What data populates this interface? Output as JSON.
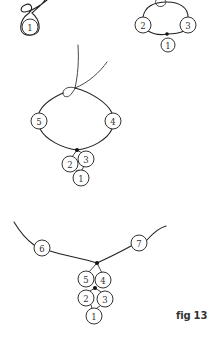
{
  "figure": {
    "caption": "fig 13",
    "colors": {
      "thread": "#222222",
      "bead_outline": "#333333",
      "knot": "#111111",
      "background": "#ffffff"
    }
  },
  "steps": [
    {
      "id": "step-1",
      "beads": [
        {
          "label": "1",
          "cx": 30,
          "cy": 27,
          "r": 8
        }
      ],
      "knots": []
    },
    {
      "id": "step-2",
      "beads": [
        {
          "label": "2",
          "cx": 143,
          "cy": 25,
          "r": 8
        },
        {
          "label": "3",
          "cx": 188,
          "cy": 25,
          "r": 8
        },
        {
          "label": "1",
          "cx": 168,
          "cy": 45,
          "r": 7
        }
      ],
      "knots": [
        {
          "cx": 167,
          "cy": 34
        }
      ]
    },
    {
      "id": "step-3",
      "beads": [
        {
          "label": "5",
          "cx": 39,
          "cy": 121,
          "r": 8
        },
        {
          "label": "4",
          "cx": 113,
          "cy": 121,
          "r": 8
        },
        {
          "label": "2",
          "cx": 70,
          "cy": 164,
          "r": 8
        },
        {
          "label": "3",
          "cx": 86,
          "cy": 159,
          "r": 8
        },
        {
          "label": "1",
          "cx": 81,
          "cy": 178,
          "r": 8
        }
      ],
      "knots": [
        {
          "cx": 77,
          "cy": 150
        }
      ]
    },
    {
      "id": "step-4",
      "beads": [
        {
          "label": "6",
          "cx": 42,
          "cy": 248,
          "r": 8
        },
        {
          "label": "7",
          "cx": 139,
          "cy": 243,
          "r": 8
        },
        {
          "label": "5",
          "cx": 86,
          "cy": 279,
          "r": 8
        },
        {
          "label": "4",
          "cx": 103,
          "cy": 280,
          "r": 8
        },
        {
          "label": "2",
          "cx": 86,
          "cy": 298,
          "r": 8
        },
        {
          "label": "3",
          "cx": 105,
          "cy": 299,
          "r": 8
        },
        {
          "label": "1",
          "cx": 94,
          "cy": 316,
          "r": 8
        }
      ],
      "knots": [
        {
          "cx": 97,
          "cy": 263
        },
        {
          "cx": 95,
          "cy": 288
        }
      ]
    }
  ]
}
